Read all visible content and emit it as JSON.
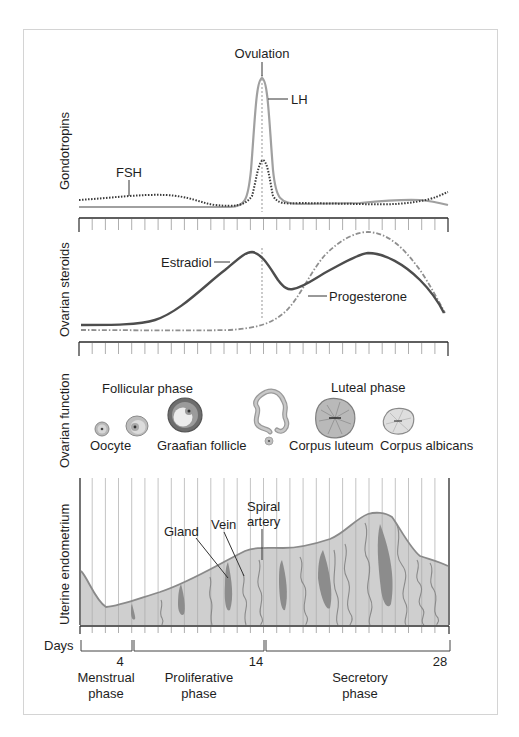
{
  "figure": {
    "panels": {
      "gonadotropins": {
        "axis_label": "Gondotropins",
        "ovulation_label": "Ovulation",
        "lh_label": "LH",
        "fsh_label": "FSH"
      },
      "ovarian_steroids": {
        "axis_label": "Ovarian steroids",
        "estradiol_label": "Estradiol",
        "progesterone_label": "Progesterone"
      },
      "ovarian_function": {
        "axis_label": "Ovarian function",
        "follicular_phase_label": "Follicular phase",
        "luteal_phase_label": "Luteal phase",
        "oocyte_label": "Oocyte",
        "graafian_label": "Graafian follicle",
        "corpus_luteum_label": "Corpus luteum",
        "corpus_albicans_label": "Corpus albicans"
      },
      "uterine_endometrium": {
        "axis_label": "Uterine endometrium",
        "gland_label": "Gland",
        "vein_label": "Vein",
        "spiral_label_1": "Spiral",
        "spiral_label_2": "artery"
      }
    },
    "days": {
      "label": "Days",
      "ticks": [
        "4",
        "14",
        "28"
      ],
      "phases": [
        {
          "line1": "Menstrual",
          "line2": "phase"
        },
        {
          "line1": "Proliferative",
          "line2": "phase"
        },
        {
          "line1": "Secretory",
          "line2": "phase"
        }
      ]
    },
    "colors": {
      "lh": "#9a9a9a",
      "fsh": "#4a4a4a",
      "estradiol": "#555555",
      "progesterone": "#8a8a8a",
      "endometrium_fill": "#cfcfcf",
      "endometrium_edge": "#8a8a8a",
      "gland": "#888888",
      "axis": "#2a2a2a"
    }
  }
}
